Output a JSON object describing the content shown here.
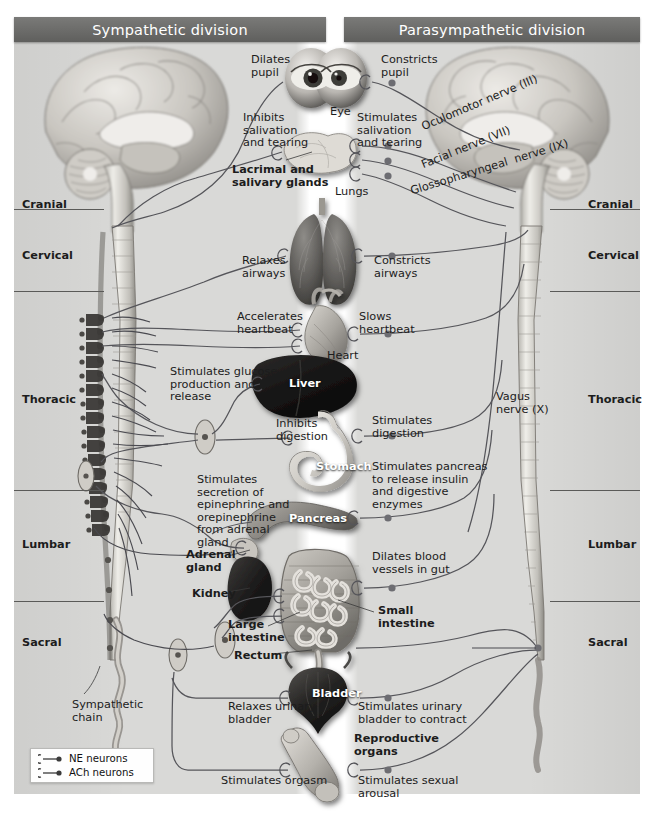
{
  "figure": {
    "background_color": "#d9d9d7",
    "header_color": "#6e6e6c",
    "header_text_color": "#ffffff"
  },
  "headers": {
    "left": "Sympathetic division",
    "right": "Parasympathetic division"
  },
  "spinal_regions": {
    "left": [
      {
        "label": "Cranial",
        "y": 205
      },
      {
        "label": "Cervical",
        "y": 256
      },
      {
        "label": "Thoracic",
        "y": 400
      },
      {
        "label": "Lumbar",
        "y": 545
      },
      {
        "label": "Sacral",
        "y": 643
      }
    ],
    "right": [
      {
        "label": "Cranial",
        "y": 205
      },
      {
        "label": "Cervical",
        "y": 256
      },
      {
        "label": "Thoracic",
        "y": 400
      },
      {
        "label": "Lumbar",
        "y": 545
      },
      {
        "label": "Sacral",
        "y": 643
      }
    ]
  },
  "organs": [
    {
      "name": "Eye",
      "x": 330,
      "y": 106,
      "style": "plain"
    },
    {
      "name": "Lacrimal and\nsalivary glands",
      "x": 232,
      "y": 164,
      "style": "bold"
    },
    {
      "name": "Lungs",
      "x": 335,
      "y": 186,
      "style": "plain"
    },
    {
      "name": "Heart",
      "x": 327,
      "y": 350,
      "style": "plain"
    },
    {
      "name": "Liver",
      "x": 289,
      "y": 378,
      "style": "white"
    },
    {
      "name": "Stomach",
      "x": 316,
      "y": 461,
      "style": "white"
    },
    {
      "name": "Pancreas",
      "x": 289,
      "y": 513,
      "style": "white"
    },
    {
      "name": "Adrenal\ngland",
      "x": 186,
      "y": 549,
      "style": "bold"
    },
    {
      "name": "Kidney",
      "x": 192,
      "y": 588,
      "style": "bold"
    },
    {
      "name": "Small\nintestine",
      "x": 378,
      "y": 605,
      "style": "bold"
    },
    {
      "name": "Large\nintestine",
      "x": 228,
      "y": 619,
      "style": "bold"
    },
    {
      "name": "Rectum",
      "x": 234,
      "y": 650,
      "style": "bold"
    },
    {
      "name": "Bladder",
      "x": 312,
      "y": 688,
      "style": "white"
    },
    {
      "name": "Reproductive\norgans",
      "x": 354,
      "y": 733,
      "style": "bold"
    },
    {
      "name": "Sympathetic\nchain",
      "x": 72,
      "y": 699,
      "style": "plain"
    }
  ],
  "sympathetic_effects": [
    {
      "text": "Dilates\npupil",
      "x": 251,
      "y": 54
    },
    {
      "text": "Inhibits\nsalivation\nand tearing",
      "x": 243,
      "y": 112
    },
    {
      "text": "Relaxes\nairways",
      "x": 242,
      "y": 255
    },
    {
      "text": "Accelerates\nheartbeat",
      "x": 237,
      "y": 311
    },
    {
      "text": "Stimulates glucose\nproduction and\nrelease",
      "x": 170,
      "y": 366
    },
    {
      "text": "Inhibits\ndigestion",
      "x": 276,
      "y": 418
    },
    {
      "text": "Stimulates\nsecretion of\nepinephrine and\norepinephrine\nfrom adrenal\ngland",
      "x": 197,
      "y": 474
    },
    {
      "text": "Relaxes urinary\nbladder",
      "x": 228,
      "y": 701
    },
    {
      "text": "Stimulates orgasm",
      "x": 221,
      "y": 775
    }
  ],
  "parasympathetic_effects": [
    {
      "text": "Constricts\npupil",
      "x": 381,
      "y": 54
    },
    {
      "text": "Stimulates\nsalivation\nand tearing",
      "x": 357,
      "y": 112
    },
    {
      "text": "Constricts\nairways",
      "x": 374,
      "y": 255
    },
    {
      "text": "Slows\nheartbeat",
      "x": 359,
      "y": 311
    },
    {
      "text": "Stimulates\ndigestion",
      "x": 372,
      "y": 415
    },
    {
      "text": "Stimulates pancreas\nto release insulin\nand digestive\nenzymes",
      "x": 372,
      "y": 461
    },
    {
      "text": "Dilates blood\nvessels in gut",
      "x": 372,
      "y": 551
    },
    {
      "text": "Stimulates urinary\nbladder to contract",
      "x": 358,
      "y": 701
    },
    {
      "text": "Stimulates sexual\narousal",
      "x": 358,
      "y": 775
    }
  ],
  "cranial_nerves": [
    {
      "label": "Oculomotor nerve (III)",
      "x": 420,
      "y": 122,
      "angle": 23
    },
    {
      "label": "Facial nerve (VII)",
      "x": 420,
      "y": 160,
      "angle": 22
    },
    {
      "label": "Glossopharyngeal  nerve (IX)",
      "x": 409,
      "y": 186,
      "angle": 17
    },
    {
      "label": "Vagus\nnerve (X)",
      "x": 496,
      "y": 391,
      "angle": 0
    }
  ],
  "legend": {
    "items": [
      {
        "label": "NE neurons",
        "symbol": "preganglionic-ganglion-postganglionic"
      },
      {
        "label": "ACh neurons",
        "symbol": "preganglionic-ganglion-postganglionic"
      }
    ]
  }
}
